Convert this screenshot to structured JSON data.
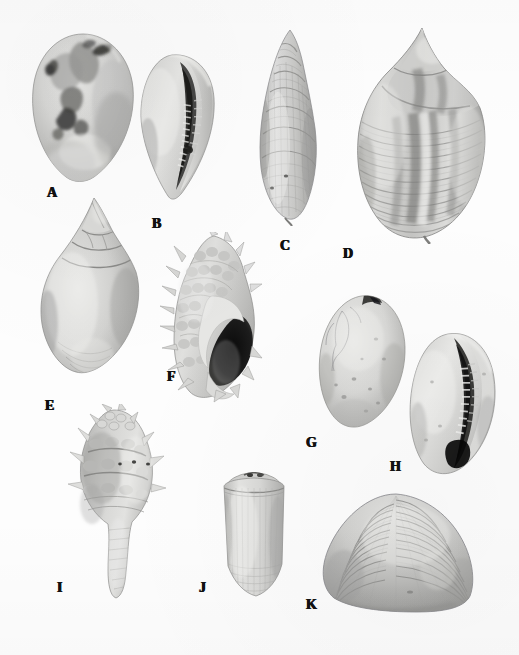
{
  "plate": {
    "title": "Plate of marine mollusc shells",
    "caption": "",
    "background_color": "#fdfdfd",
    "label_color": "#111111",
    "rendering": "black-and-white photographic plate",
    "width": 519,
    "height": 655,
    "specimen_count": 11
  },
  "figures": [
    {
      "id": "A",
      "label": "A",
      "name": "cowrie-dorsal-view",
      "description": "Cowrie shell, dorsal view, mottled dark blotches",
      "label_x": 47,
      "label_y": 186,
      "box": {
        "x": 28,
        "y": 32,
        "width": 110,
        "height": 152
      },
      "tone": "mottled"
    },
    {
      "id": "B",
      "label": "B",
      "name": "cowrie-ventral-view",
      "description": "Cowrie shell, ventral view showing toothed aperture",
      "label_x": 152,
      "label_y": 217,
      "box": {
        "x": 132,
        "y": 52,
        "width": 88,
        "height": 152
      },
      "tone": "pale"
    },
    {
      "id": "C",
      "label": "C",
      "name": "turreted-spire-shell",
      "description": "Tall turreted shell with beaded spiral sculpture",
      "label_x": 280,
      "label_y": 239,
      "box": {
        "x": 252,
        "y": 28,
        "width": 74,
        "height": 198
      },
      "tone": "medium"
    },
    {
      "id": "D",
      "label": "D",
      "name": "tun-or-helmet-shell",
      "description": "Large globose shell with strong spiral ribs and banding",
      "label_x": 343,
      "label_y": 247,
      "box": {
        "x": 352,
        "y": 26,
        "width": 138,
        "height": 218
      },
      "tone": "banded"
    },
    {
      "id": "E",
      "label": "E",
      "name": "whelk-shell",
      "description": "Smooth fusiform whelk with high spire",
      "label_x": 45,
      "label_y": 399,
      "box": {
        "x": 32,
        "y": 196,
        "width": 118,
        "height": 192
      },
      "tone": "smooth"
    },
    {
      "id": "F",
      "label": "F",
      "name": "murex-aperture-view",
      "description": "Spiny murex shell, apertural view with dark aperture",
      "label_x": 167,
      "label_y": 370,
      "box": {
        "x": 156,
        "y": 232,
        "width": 110,
        "height": 172
      },
      "tone": "spiny"
    },
    {
      "id": "G",
      "label": "G",
      "name": "egg-cowrie-dorsal-view",
      "description": "Smooth ovate cowrie, dorsal view with fine cracks",
      "label_x": 306,
      "label_y": 436,
      "box": {
        "x": 314,
        "y": 293,
        "width": 96,
        "height": 140
      },
      "tone": "pale"
    },
    {
      "id": "H",
      "label": "H",
      "name": "egg-cowrie-ventral-view",
      "description": "Ovate cowrie, ventral view with dark toothed aperture slit",
      "label_x": 390,
      "label_y": 460,
      "box": {
        "x": 404,
        "y": 330,
        "width": 98,
        "height": 148
      },
      "tone": "pale"
    },
    {
      "id": "I",
      "label": "I",
      "name": "spiny-rock-shell",
      "description": "Knobbed and spined rock shell with long siphonal canal",
      "label_x": 57,
      "label_y": 581,
      "box": {
        "x": 58,
        "y": 404,
        "width": 116,
        "height": 196
      },
      "tone": "knobbed"
    },
    {
      "id": "J",
      "label": "J",
      "name": "cone-shell",
      "description": "Conical cone shell with flat spire and fine striae",
      "label_x": 199,
      "label_y": 581,
      "box": {
        "x": 212,
        "y": 472,
        "width": 84,
        "height": 128
      },
      "tone": "pale"
    },
    {
      "id": "K",
      "label": "K",
      "name": "venus-clam-bivalve",
      "description": "Bivalve clam valve with concentric growth ribs",
      "label_x": 306,
      "label_y": 598,
      "box": {
        "x": 318,
        "y": 492,
        "width": 160,
        "height": 124
      },
      "tone": "ribbed"
    }
  ]
}
